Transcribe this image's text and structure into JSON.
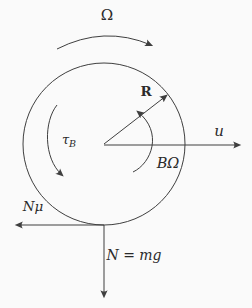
{
  "figure": {
    "background_color": "#fafafa",
    "stroke_color": "#3f3f3f",
    "labels": {
      "angular_velocity": "Ω",
      "radius_vector": "R",
      "translational_velocity": "u",
      "torque_symbol": "τ",
      "torque_subscript": "B",
      "precession_rate": "BΩ",
      "friction_force": "Nμ",
      "normal_force": "N = mg"
    }
  }
}
